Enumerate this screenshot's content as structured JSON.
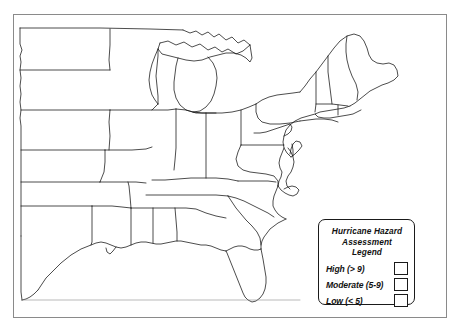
{
  "map": {
    "title": "Eastern United States outline map",
    "background_color": "#ffffff",
    "outline_color": "#111111",
    "frame_color": "#8a8a8a",
    "region": "Eastern and Central United States",
    "features": "state boundaries, coastline, Great Lakes, Florida peninsula, Gulf Coast, Chesapeake Bay, Maine"
  },
  "legend": {
    "title_line1": "Hurricane Hazard",
    "title_line2": "Assessment Legend",
    "rows": [
      {
        "label": "High (> 9)",
        "swatch_color": "#ffffff"
      },
      {
        "label": "Moderate (5-9)",
        "swatch_color": "#ffffff"
      },
      {
        "label": "Low (< 5)",
        "swatch_color": "#ffffff"
      }
    ]
  }
}
